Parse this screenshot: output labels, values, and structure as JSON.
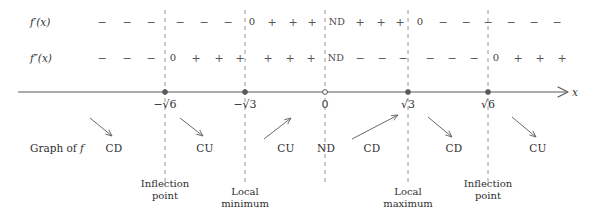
{
  "diagram": {
    "title_text": "",
    "axis_label": "x",
    "row_labels": {
      "first_derivative": "f′(x)",
      "second_derivative": "f″(x)",
      "graph_of_f": "Graph of f"
    },
    "colors": {
      "ink": "#3a3a3a",
      "axis": "#5a5a5a",
      "dashed_guide": "#9a9a9a",
      "arrow": "#6a6a6a",
      "text": "#2f2f2f"
    },
    "tick_labels": [
      {
        "id": "neg-sqrt6",
        "text": "−√6",
        "x": 165,
        "marker": "filled"
      },
      {
        "id": "neg-sqrt3",
        "text": "−√3",
        "x": 245,
        "marker": "filled"
      },
      {
        "id": "zero",
        "text": "0",
        "x": 325,
        "marker": "open"
      },
      {
        "id": "sqrt3",
        "text": "√3",
        "x": 408,
        "marker": "filled"
      },
      {
        "id": "sqrt6",
        "text": "√6",
        "x": 488,
        "marker": "filled"
      }
    ],
    "guides": [
      {
        "id": "guide-neg-sqrt6",
        "x": 165,
        "top": 10,
        "bottom": 185
      },
      {
        "id": "guide-neg-sqrt3",
        "x": 245,
        "top": 10,
        "bottom": 185
      },
      {
        "id": "guide-zero",
        "x": 325,
        "top": 10,
        "bottom": 185
      },
      {
        "id": "guide-sqrt3",
        "x": 408,
        "top": 10,
        "bottom": 185
      },
      {
        "id": "guide-sqrt6",
        "x": 488,
        "top": 10,
        "bottom": 185
      }
    ],
    "row1": {
      "label": "f′(x)",
      "label_x": 30,
      "y": 22,
      "cells": [
        {
          "t": "−",
          "x": 102
        },
        {
          "t": "−",
          "x": 127
        },
        {
          "t": "−",
          "x": 151
        },
        {
          "t": "−",
          "x": 180
        },
        {
          "t": "−",
          "x": 204
        },
        {
          "t": "−",
          "x": 228
        },
        {
          "t": "0",
          "x": 252,
          "kind": "zero"
        },
        {
          "t": "+",
          "x": 272
        },
        {
          "t": "+",
          "x": 293
        },
        {
          "t": "+",
          "x": 312
        },
        {
          "t": "ND",
          "x": 337,
          "kind": "nd"
        },
        {
          "t": "+",
          "x": 360
        },
        {
          "t": "+",
          "x": 381
        },
        {
          "t": "+",
          "x": 400
        },
        {
          "t": "0",
          "x": 420,
          "kind": "zero"
        },
        {
          "t": "−",
          "x": 443
        },
        {
          "t": "−",
          "x": 466
        },
        {
          "t": "−",
          "x": 488
        },
        {
          "t": "−",
          "x": 511
        },
        {
          "t": "−",
          "x": 534
        },
        {
          "t": "−",
          "x": 557
        }
      ]
    },
    "row2": {
      "label": "f″(x)",
      "label_x": 30,
      "y": 58,
      "cells": [
        {
          "t": "−",
          "x": 102
        },
        {
          "t": "−",
          "x": 127
        },
        {
          "t": "−",
          "x": 151
        },
        {
          "t": "0",
          "x": 173,
          "kind": "zero"
        },
        {
          "t": "+",
          "x": 196
        },
        {
          "t": "+",
          "x": 219
        },
        {
          "t": "+",
          "x": 240
        },
        {
          "t": "+",
          "x": 268
        },
        {
          "t": "+",
          "x": 290
        },
        {
          "t": "+",
          "x": 311
        },
        {
          "t": "ND",
          "x": 336,
          "kind": "nd"
        },
        {
          "t": "−",
          "x": 360
        },
        {
          "t": "−",
          "x": 382
        },
        {
          "t": "−",
          "x": 403
        },
        {
          "t": "−",
          "x": 430
        },
        {
          "t": "−",
          "x": 452
        },
        {
          "t": "−",
          "x": 474
        },
        {
          "t": "0",
          "x": 496,
          "kind": "zero"
        },
        {
          "t": "+",
          "x": 518
        },
        {
          "t": "+",
          "x": 540
        },
        {
          "t": "+",
          "x": 562
        }
      ]
    },
    "axis": {
      "y": 92,
      "x_start": 18,
      "x_end": 562,
      "label_x": 572,
      "label_y": 92
    },
    "concavity": {
      "label": "Graph of f",
      "label_x": 30,
      "y": 148,
      "items": [
        {
          "id": "cd-1",
          "text": "CD",
          "x": 114,
          "arrow": "down-right",
          "ax1": 90,
          "ay1": 118,
          "ax2": 112,
          "ay2": 136
        },
        {
          "id": "cu-1",
          "text": "CU",
          "x": 205,
          "arrow": "down-right",
          "ax1": 180,
          "ay1": 118,
          "ax2": 203,
          "ay2": 136
        },
        {
          "id": "cu-2",
          "text": "CU",
          "x": 286,
          "arrow": "up-right",
          "ax1": 264,
          "ay1": 139,
          "ax2": 291,
          "ay2": 118
        },
        {
          "id": "nd-1",
          "text": "ND",
          "x": 326,
          "arrow": "none"
        },
        {
          "id": "cd-2",
          "text": "CD",
          "x": 372,
          "arrow": "up-right",
          "ax1": 352,
          "ay1": 139,
          "ax2": 398,
          "ay2": 115
        },
        {
          "id": "cd-3",
          "text": "CD",
          "x": 454,
          "arrow": "down-right",
          "ax1": 428,
          "ay1": 117,
          "ax2": 452,
          "ay2": 137
        },
        {
          "id": "cu-3",
          "text": "CU",
          "x": 538,
          "arrow": "down-right",
          "ax1": 512,
          "ay1": 117,
          "ax2": 536,
          "ay2": 137
        }
      ]
    },
    "captions": [
      {
        "id": "inflection-point-1",
        "x": 165,
        "y": 178,
        "line1": "Inflection",
        "line2": "point"
      },
      {
        "id": "local-minimum",
        "x": 245,
        "y": 186,
        "line1": "Local",
        "line2": "minimum"
      },
      {
        "id": "local-maximum",
        "x": 408,
        "y": 186,
        "line1": "Local",
        "line2": "maximum"
      },
      {
        "id": "inflection-point-2",
        "x": 488,
        "y": 178,
        "line1": "Inflection",
        "line2": "point"
      }
    ]
  }
}
